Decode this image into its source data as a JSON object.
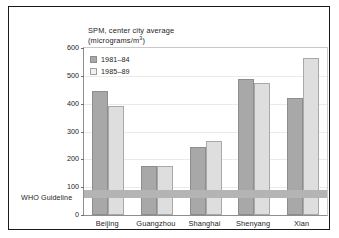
{
  "chart_data": {
    "type": "bar",
    "title": "SPM, center city average",
    "subtitle": "(micrograms/m³)",
    "subtitle_base": "(micrograms/m",
    "subtitle_sup": "3",
    "subtitle_tail": ")",
    "xlabel": "",
    "ylabel": "",
    "ylim": [
      0,
      600
    ],
    "yticks": [
      0,
      100,
      200,
      300,
      400,
      500,
      600
    ],
    "ytick_labels": [
      "0",
      "100",
      "200",
      "300",
      "400",
      "500",
      "600"
    ],
    "grid": false,
    "legend_position": "top-left inside plot",
    "categories": [
      "Beijing",
      "Guangzhou",
      "Shanghai",
      "Shenyang",
      "Xian"
    ],
    "series": [
      {
        "name": "1981–84",
        "color": "#a8a8a8",
        "values": [
          445,
          175,
          245,
          490,
          420
        ]
      },
      {
        "name": "1985–89",
        "color": "#dedede",
        "values": [
          390,
          175,
          267,
          475,
          565
        ]
      }
    ],
    "annotations": [
      {
        "name": "who-guideline-band",
        "label": "WHO Guideline",
        "range": [
          60,
          90
        ],
        "color": "#b4b4b4"
      }
    ]
  },
  "legend": {
    "items": [
      {
        "label": "1981–84"
      },
      {
        "label": "1985–89"
      }
    ]
  },
  "axis": {
    "who_label": "WHO Guideline"
  }
}
